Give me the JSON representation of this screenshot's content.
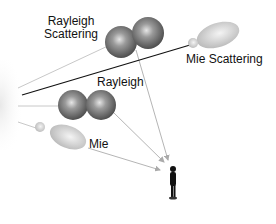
{
  "diagram": {
    "labels": {
      "rayleigh_scattering_line1": "Rayleigh",
      "rayleigh_scattering_line2": "Scattering",
      "mie_scattering": "Mie Scattering",
      "rayleigh": "Rayleigh",
      "mie": "Mie"
    },
    "colors": {
      "sphere_dark": "#555555",
      "sphere_light": "#cfcfcf",
      "mie_lobe": "#d8d8d8",
      "ray_line": "#bdbdbd",
      "sun_line": "#111111",
      "person": "#111111"
    }
  }
}
